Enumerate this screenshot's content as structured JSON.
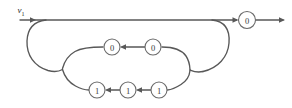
{
  "diagram": {
    "type": "flow-graph",
    "title": "",
    "canvas": {
      "width": 292,
      "height": 108
    },
    "colors": {
      "edge": "#585858",
      "node_stroke": "#6a6a6a",
      "node_fill": "#ffffff",
      "text": "#3b3b3b",
      "background": "#ffffff"
    },
    "input_label": {
      "base": "v",
      "subscript": "1",
      "full": "v1",
      "x": 22,
      "y": 11
    },
    "nodes": [
      {
        "id": "n-out",
        "label": "0",
        "x": 247,
        "y": 20,
        "r": 8.5,
        "row": "top-right"
      },
      {
        "id": "n-top1",
        "label": "0",
        "x": 112,
        "y": 47,
        "r": 8.0,
        "row": "upper-inner"
      },
      {
        "id": "n-top2",
        "label": "0",
        "x": 153,
        "y": 47,
        "r": 8.0,
        "row": "upper-inner"
      },
      {
        "id": "n-bot1",
        "label": "1",
        "x": 97,
        "y": 90,
        "r": 8.0,
        "row": "lower-inner"
      },
      {
        "id": "n-bot2",
        "label": "1",
        "x": 128,
        "y": 90,
        "r": 8.0,
        "row": "lower-inner"
      },
      {
        "id": "n-bot3",
        "label": "1",
        "x": 159,
        "y": 90,
        "r": 8.0,
        "row": "lower-inner"
      }
    ],
    "edges": [
      {
        "id": "e-input-main",
        "from": "input",
        "to": "n-out",
        "direction": "right",
        "description": "main horizontal line from v1 into output node"
      },
      {
        "id": "e-out-exit",
        "from": "n-out",
        "to": "exit",
        "direction": "right",
        "description": "exit arrow leaving output node"
      },
      {
        "id": "e-outer-loop",
        "from": "n-out",
        "to": "input",
        "direction": "loop",
        "description": "large outer feedback loop"
      },
      {
        "id": "e-top2-top1",
        "from": "n-top2",
        "to": "n-top1",
        "direction": "left",
        "description": "arrow between upper 0 nodes"
      },
      {
        "id": "e-bot3-bot2",
        "from": "n-bot3",
        "to": "n-bot2",
        "direction": "left",
        "description": "arrow between lower 1 nodes"
      },
      {
        "id": "e-bot2-bot1",
        "from": "n-bot2",
        "to": "n-bot1",
        "direction": "left",
        "description": "arrow between lower 1 nodes"
      },
      {
        "id": "e-inner-left",
        "from": "n-top1",
        "to": "n-bot1",
        "direction": "loop",
        "description": "inner left cusp joining upper and lower rows"
      },
      {
        "id": "e-inner-right",
        "from": "n-bot3",
        "to": "n-top2",
        "direction": "loop",
        "description": "inner right cusp joining lower and upper rows"
      }
    ],
    "arrow_markers": [
      {
        "id": "a-main-in",
        "x": 42,
        "y": 20,
        "direction": "right"
      },
      {
        "id": "a-into-out",
        "x": 236,
        "y": 20,
        "direction": "right"
      },
      {
        "id": "a-exit",
        "x": 283,
        "y": 20,
        "direction": "right"
      },
      {
        "id": "a-top-mid",
        "x": 123,
        "y": 47,
        "direction": "left"
      },
      {
        "id": "a-bot-mid1",
        "x": 108,
        "y": 90,
        "direction": "left"
      },
      {
        "id": "a-bot-mid2",
        "x": 139,
        "y": 90,
        "direction": "left"
      }
    ]
  }
}
